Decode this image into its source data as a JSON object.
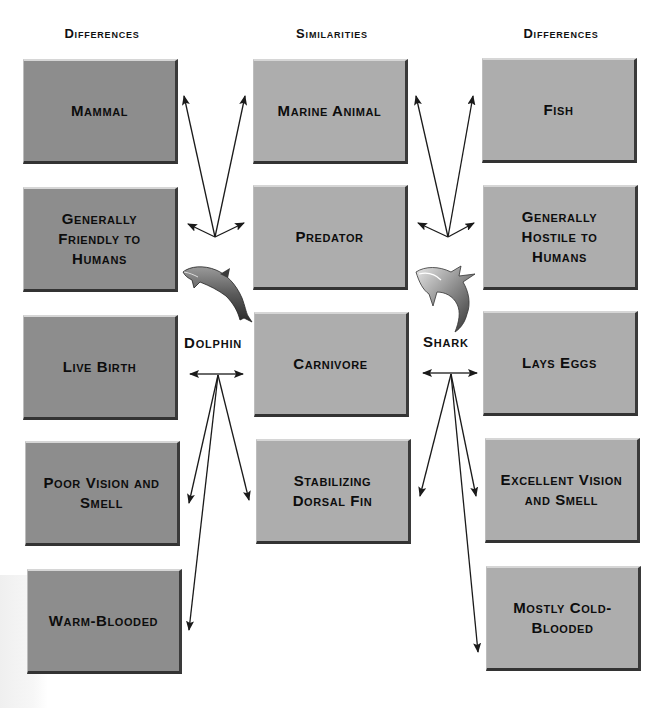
{
  "headings": {
    "left": "Differences",
    "middle": "Similarities",
    "right": "Differences"
  },
  "labels": {
    "dolphin": "Dolphin",
    "shark": "Shark"
  },
  "dolphin_differences": [
    "Mammal",
    "Generally Friendly to Humans",
    "Live Birth",
    "Poor Vision and Smell",
    "Warm-Blooded"
  ],
  "similarities": [
    "Marine Animal",
    "Predator",
    "Carnivore",
    "Stabilizing Dorsal Fin"
  ],
  "shark_differences": [
    "Fish",
    "Generally Hostile to Humans",
    "Lays Eggs",
    "Excellent Vision and Smell",
    "Mostly Cold-Blooded"
  ],
  "icons": {
    "dolphin": "dolphin-icon",
    "shark": "shark-icon"
  },
  "colors": {
    "dolphin_box": "#8d8d8d",
    "shared_box": "#adadad",
    "shark_box": "#adadad",
    "arrow": "#1a1a1a"
  }
}
